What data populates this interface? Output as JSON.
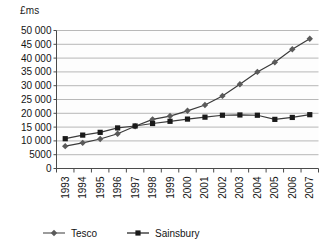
{
  "chart_data": {
    "type": "line",
    "title": "",
    "ylabel": "£ms",
    "xlabel": "",
    "ylim": [
      0,
      50000
    ],
    "ytick_labels": [
      "0",
      "5000",
      "10 000",
      "15 000",
      "20 000",
      "25 000",
      "30 000",
      "35 000",
      "40 000",
      "45 000",
      "50 000"
    ],
    "ytick_values": [
      0,
      5000,
      10000,
      15000,
      20000,
      25000,
      30000,
      35000,
      40000,
      45000,
      50000
    ],
    "grid": true,
    "legend_position": "bottom",
    "categories": [
      "1993",
      "1994",
      "1995",
      "1996",
      "1997",
      "1998",
      "1999",
      "2000",
      "2001",
      "2002",
      "2003",
      "2004",
      "2005",
      "2006",
      "2007"
    ],
    "series": [
      {
        "name": "Tesco",
        "marker": "diamond",
        "color": "#5a5a5a",
        "values": [
          8100,
          9300,
          10700,
          12600,
          15300,
          17800,
          19000,
          20900,
          23000,
          26300,
          30500,
          35000,
          38500,
          43200,
          47000
        ]
      },
      {
        "name": "Sainsbury",
        "marker": "square",
        "color": "#1a1a1a",
        "values": [
          10800,
          12100,
          13100,
          14700,
          15400,
          16300,
          17100,
          17900,
          18600,
          19300,
          19400,
          19300,
          17800,
          18500,
          19500
        ]
      }
    ]
  },
  "legend": {
    "items": [
      {
        "label": "Tesco"
      },
      {
        "label": "Sainsbury"
      }
    ]
  },
  "axis": {
    "unit_label": "£ms"
  }
}
